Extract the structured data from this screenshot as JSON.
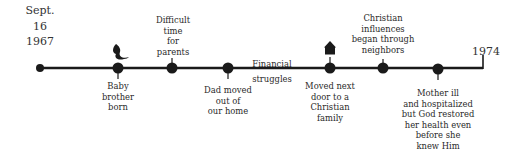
{
  "timeline": {
    "start_label": "Sept.\n16\n1967",
    "end_label": "1974",
    "colors": {
      "line": "#1a1a1a",
      "dot": "#1a1a1a",
      "text": "#2a2a2a"
    },
    "events": [
      {
        "label": "Baby\nbrother\nborn",
        "position": "below",
        "icon": "baby-icon"
      },
      {
        "label": "Difficult\ntime\nfor\nparents",
        "position": "above"
      },
      {
        "label": "Dad moved\nout of\nour home",
        "position": "below"
      },
      {
        "label": "Financial\nstruggles",
        "position": "on-line"
      },
      {
        "label": "Moved next\ndoor to a\nChristian\nfamily",
        "position": "below",
        "icon": "house-icon"
      },
      {
        "label": "Christian\ninfluences\nbegan through\nneighbors",
        "position": "above"
      },
      {
        "label": "Mother ill\nand hospitalized\nbut God restored\nher health even\nbefore she\nknew Him",
        "position": "below"
      }
    ]
  }
}
